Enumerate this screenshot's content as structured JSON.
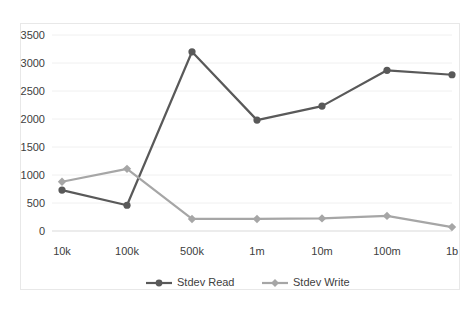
{
  "chart_data": {
    "type": "line",
    "title": "",
    "subtitle": "",
    "xlabel": "",
    "ylabel": "",
    "categories": [
      "10k",
      "100k",
      "500k",
      "1m",
      "10m",
      "100m",
      "1b"
    ],
    "series": [
      {
        "name": "Stdev Read",
        "color": "#595959",
        "marker": "circle",
        "values": [
          730,
          460,
          3200,
          1980,
          2230,
          2870,
          2790
        ]
      },
      {
        "name": "Stdev Write",
        "color": "#a6a6a6",
        "marker": "diamond",
        "values": [
          880,
          1110,
          215,
          215,
          225,
          270,
          70
        ]
      }
    ],
    "yticks": [
      0,
      500,
      1000,
      1500,
      2000,
      2500,
      3000,
      3500
    ],
    "ylim": [
      0,
      3500
    ],
    "grid": true,
    "grid_axis": "y",
    "legend_position": "bottom",
    "legend": [
      "Stdev Read",
      "Stdev Write"
    ],
    "annotations": []
  },
  "style": {
    "background": "#ffffff",
    "border_color": "#e8e8e8",
    "gridline_color": "#f0f0f0",
    "tick_text_color": "#404040"
  }
}
